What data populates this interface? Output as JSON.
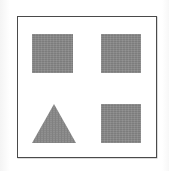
{
  "figure": {
    "canvas": {
      "width": 169,
      "height": 171,
      "background_color": "#ffffff"
    },
    "frame": {
      "name": "panel-border",
      "border_color": "#4a4a4a",
      "fill_color": "#ffffff",
      "border_width_px": 1.5,
      "x": 17,
      "y": 16,
      "width": 140,
      "height": 142
    },
    "shape_fill_color": "#878787",
    "shapes": [
      {
        "id": "top-left",
        "kind": "square",
        "label": "Square",
        "grid_row": 1,
        "grid_column": 1,
        "x": 32,
        "y": 34,
        "width": 41,
        "height": 39,
        "fill": "#878787"
      },
      {
        "id": "top-right",
        "kind": "square",
        "label": "Square",
        "grid_row": 1,
        "grid_column": 2,
        "x": 101,
        "y": 34,
        "width": 40,
        "height": 39,
        "fill": "#878787"
      },
      {
        "id": "bottom-left",
        "kind": "triangle",
        "label": "Triangle",
        "grid_row": 2,
        "grid_column": 1,
        "x": 31,
        "y": 103,
        "width": 46,
        "height": 41,
        "fill": "#878787",
        "points": "23,1 45,40 1,40"
      },
      {
        "id": "bottom-right",
        "kind": "square",
        "label": "Square",
        "grid_row": 2,
        "grid_column": 2,
        "x": 101,
        "y": 104,
        "width": 40,
        "height": 39,
        "fill": "#878787"
      }
    ],
    "counts": {
      "squares": 3,
      "triangles": 1,
      "total": 4
    }
  }
}
